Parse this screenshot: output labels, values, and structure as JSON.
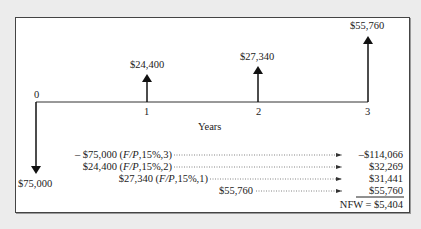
{
  "diagram": {
    "type": "cash-flow-diagram",
    "axis_label": "Years",
    "periods": [
      "0",
      "1",
      "2",
      "3"
    ],
    "cash_flows": [
      {
        "period": "0",
        "label": "$75,000",
        "direction": "down"
      },
      {
        "period": "1",
        "label": "$24,400",
        "direction": "up"
      },
      {
        "period": "2",
        "label": "$27,340",
        "direction": "up"
      },
      {
        "period": "3",
        "label": "$55,760",
        "direction": "up"
      }
    ],
    "calculations": [
      {
        "prefix": "– $75,000 (",
        "factor": "F/P",
        "suffix": ",15%,3)",
        "result": "–$114,066"
      },
      {
        "prefix": "$24,400 (",
        "factor": "F/P",
        "suffix": ",15%,2)",
        "result": "$32,269"
      },
      {
        "prefix": "$27,340 (",
        "factor": "F/P",
        "suffix": ",15%,1)",
        "result": "$31,441"
      },
      {
        "prefix": "$55,760",
        "factor": "",
        "suffix": "",
        "result": "$55,760"
      }
    ],
    "total": "NFW = $5,404"
  }
}
